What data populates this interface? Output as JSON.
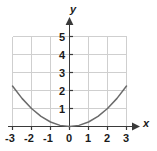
{
  "chart_data": {
    "type": "line",
    "title": "",
    "xlabel": "x",
    "ylabel": "y",
    "function": "y = x^2/4",
    "xlim": [
      -3,
      3
    ],
    "ylim": [
      0,
      5
    ],
    "grid": true,
    "legend": "none",
    "xticks": [
      "-3",
      "-2",
      "-1",
      "0",
      "1",
      "2",
      "3"
    ],
    "xtick_values": [
      -3,
      -2,
      -1,
      0,
      1,
      2,
      3
    ],
    "yticks": [
      "1",
      "2",
      "3",
      "4",
      "5"
    ],
    "ytick_values": [
      1,
      2,
      3,
      4,
      5
    ],
    "x": [
      -3,
      -2.5,
      -2,
      -1.5,
      -1,
      -0.5,
      0,
      0.5,
      1,
      1.5,
      2,
      2.5,
      3
    ],
    "y": [
      2.25,
      1.5625,
      1.0,
      0.5625,
      0.25,
      0.0625,
      0,
      0.0625,
      0.25,
      0.5625,
      1.0,
      1.5625,
      2.25
    ],
    "series": [
      {
        "name": "parabola",
        "values": [
          2.25,
          1.5625,
          1.0,
          0.5625,
          0.25,
          0.0625,
          0,
          0.0625,
          0.25,
          0.5625,
          1.0,
          1.5625,
          2.25
        ]
      }
    ],
    "annotations": []
  },
  "colors": {
    "curve": "#6b6b6b",
    "grid": "#cfcfcf",
    "axis": "#3a3a3a",
    "text": "#1a1a1a",
    "background": "#ffffff"
  },
  "axis_titles": {
    "x": "x",
    "y": "y"
  }
}
